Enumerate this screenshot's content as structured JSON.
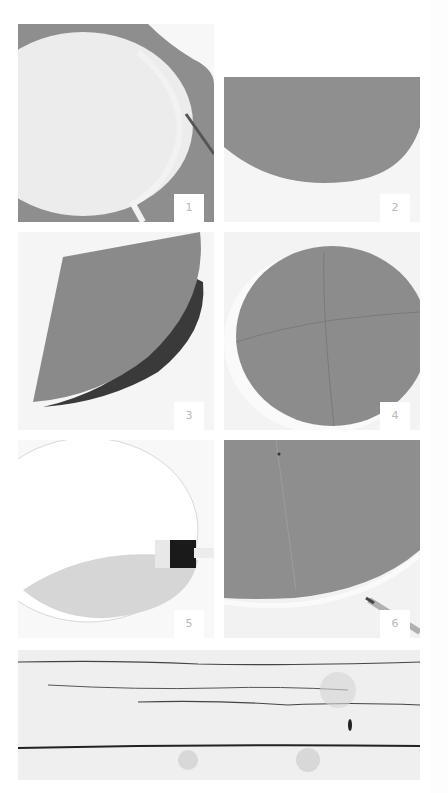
{
  "steps": [
    {
      "number": "1",
      "caption_icon": "scissors-cutting-circle"
    },
    {
      "number": "2",
      "caption_icon": "half-circle-paper"
    },
    {
      "number": "3",
      "caption_icon": "folded-quarter-paper"
    },
    {
      "number": "4",
      "caption_icon": "circle-with-fold-lines"
    },
    {
      "number": "5",
      "caption_icon": "glue-brush-on-circle"
    },
    {
      "number": "6",
      "caption_icon": "pencil-marking-circle"
    }
  ],
  "footer": {
    "texture": "white-washed-wood"
  },
  "colors": {
    "paper_gray": "#8c8c8c",
    "paper_light": "#ededed",
    "background": "#ffffff",
    "label_text": "#b8b8b8"
  }
}
